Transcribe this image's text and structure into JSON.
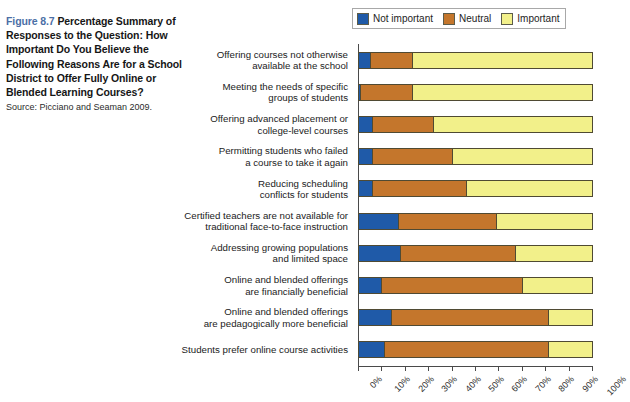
{
  "caption": {
    "figure_number": "Figure 8.7",
    "title": "Percentage Summary of Responses to the Question: How Important Do You Believe the Following Reasons Are for a School District to Offer Fully Online or Blended Learning Courses?",
    "source": "Source: Picciano and Seaman 2009.",
    "figure_number_color": "#4b6fa6"
  },
  "legend": {
    "position": "top-right",
    "items": [
      {
        "label": "Not important",
        "color": "#1f5aa8"
      },
      {
        "label": "Neutral",
        "color": "#c4762c"
      },
      {
        "label": "Important",
        "color": "#f2f08a"
      }
    ]
  },
  "chart_data": {
    "type": "bar",
    "orientation": "horizontal",
    "stacked": true,
    "title": "",
    "xlabel": "",
    "ylabel": "",
    "xlim": [
      0,
      100
    ],
    "grid": false,
    "xticks": [
      "0%",
      "10%",
      "20%",
      "30%",
      "40%",
      "50%",
      "60%",
      "70%",
      "80%",
      "90%",
      "100%"
    ],
    "xtick_values": [
      0,
      10,
      20,
      30,
      40,
      50,
      60,
      70,
      80,
      90,
      100
    ],
    "categories": [
      "Offering courses not otherwise\navailable at the school",
      "Meeting the needs of specific\ngroups of students",
      "Offering advanced placement or\ncollege-level courses",
      "Permitting students who failed\na course to take it again",
      "Reducing scheduling\nconflicts for students",
      "Certified teachers are not available for\ntraditional face-to-face instruction",
      "Addressing growing populations\nand limited space",
      "Online and blended offerings\nare financially beneficial",
      "Online and blended offerings\nare pedagogically more beneficial",
      "Students prefer online course activities"
    ],
    "series": [
      {
        "name": "Not important",
        "color": "#1f5aa8",
        "values": [
          5,
          1,
          6,
          6,
          6,
          17,
          18,
          10,
          14,
          11
        ]
      },
      {
        "name": "Neutral",
        "color": "#c4762c",
        "values": [
          18,
          22,
          26,
          34,
          40,
          42,
          49,
          60,
          67,
          70
        ]
      },
      {
        "name": "Important",
        "color": "#f2f08a",
        "values": [
          77,
          77,
          68,
          60,
          54,
          41,
          33,
          30,
          19,
          19
        ]
      }
    ]
  }
}
